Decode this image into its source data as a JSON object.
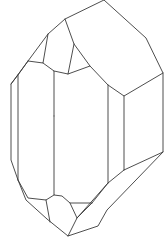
{
  "figure": {
    "title": "Crystal line drawing",
    "stroke_color": "#3a3a3a",
    "background": "#ffffff",
    "outline": [
      [
        104,
        0
      ],
      [
        146,
        38
      ],
      [
        163,
        73
      ],
      [
        163,
        152
      ],
      [
        107,
        210
      ],
      [
        98,
        226
      ],
      [
        68,
        236
      ],
      [
        47,
        219
      ],
      [
        26,
        200
      ],
      [
        18,
        180
      ],
      [
        11,
        160
      ],
      [
        11,
        84
      ],
      [
        28,
        61
      ],
      [
        48,
        34
      ],
      [
        65,
        19
      ],
      [
        104,
        0
      ]
    ],
    "edges": [
      [
        [
          65,
          19
        ],
        [
          74,
          44
        ],
        [
          90,
          66
        ],
        [
          68,
          74
        ],
        [
          54,
          71
        ]
      ],
      [
        [
          48,
          34
        ],
        [
          43,
          63
        ],
        [
          28,
          61
        ]
      ],
      [
        [
          43,
          63
        ],
        [
          54,
          71
        ],
        [
          54,
          116
        ]
      ],
      [
        [
          74,
          44
        ],
        [
          68,
          74
        ]
      ],
      [
        [
          18,
          75
        ],
        [
          18,
          180
        ]
      ],
      [
        [
          11,
          84
        ],
        [
          18,
          75
        ],
        [
          28,
          61
        ]
      ],
      [
        [
          90,
          66
        ],
        [
          108,
          85
        ],
        [
          124,
          96
        ],
        [
          163,
          73
        ]
      ],
      [
        [
          108,
          85
        ],
        [
          108,
          183
        ]
      ],
      [
        [
          124,
          96
        ],
        [
          124,
          170
        ]
      ],
      [
        [
          124,
          170
        ],
        [
          163,
          152
        ]
      ],
      [
        [
          124,
          170
        ],
        [
          108,
          183
        ],
        [
          77,
          218
        ]
      ],
      [
        [
          18,
          180
        ],
        [
          28,
          198
        ],
        [
          46,
          200
        ],
        [
          54,
          195
        ]
      ],
      [
        [
          54,
          116
        ],
        [
          54,
          195
        ],
        [
          62,
          196
        ],
        [
          70,
          203
        ],
        [
          92,
          203
        ]
      ],
      [
        [
          46,
          200
        ],
        [
          50,
          222
        ]
      ],
      [
        [
          70,
          203
        ],
        [
          77,
          218
        ],
        [
          68,
          236
        ]
      ],
      [
        [
          92,
          203
        ],
        [
          77,
          218
        ]
      ],
      [
        [
          92,
          203
        ],
        [
          108,
          183
        ]
      ]
    ]
  }
}
